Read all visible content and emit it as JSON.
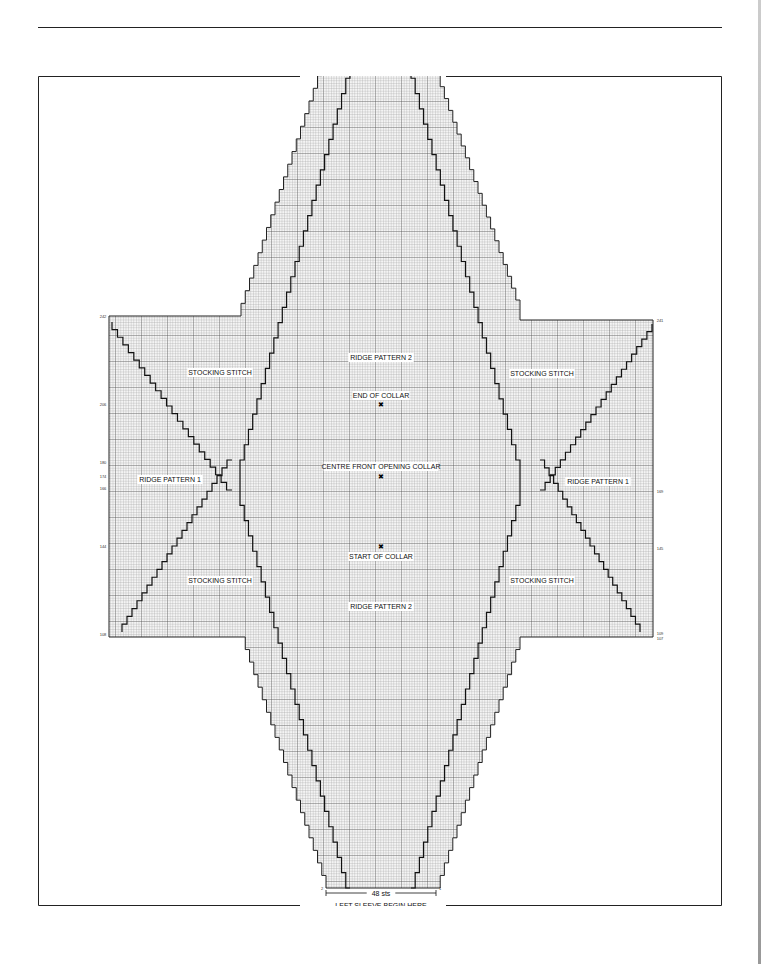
{
  "diagram": {
    "type": "knitting-chart",
    "labels": {
      "ridge_top": "RIDGE PATTERN 2",
      "ridge_bottom": "RIDGE PATTERN 2",
      "ridge_left": "RIDGE PATTERN 1",
      "ridge_right": "RIDGE PATTERN 1",
      "stocking_tl": "STOCKING STITCH",
      "stocking_tr": "STOCKING STITCH",
      "stocking_bl": "STOCKING STITCH",
      "stocking_br": "STOCKING STITCH",
      "end_collar": "END OF COLLAR",
      "centre_front": "CENTRE FRONT OPENING COLLAR",
      "start_collar": "START OF COLLAR"
    },
    "width_label": "48 sts",
    "begin_label": "LEFT SLEEVE BEGIN HERE",
    "row_numbers": {
      "top": "348",
      "left": [
        "242",
        "206",
        "180",
        "174",
        "166",
        "144",
        "108"
      ],
      "right": [
        "241",
        "169",
        "145",
        "109",
        "107"
      ],
      "bottom_left": "2",
      "bottom_right": "1"
    },
    "markers": [
      "end-of-collar",
      "centre-front-opening",
      "start-of-collar"
    ]
  }
}
